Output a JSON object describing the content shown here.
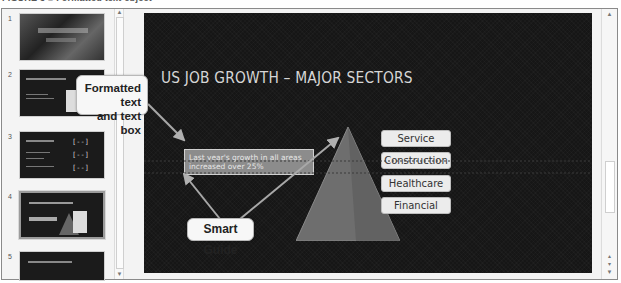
{
  "caption": "FIGURE 3 ■ Formatted text object",
  "thumbnails": [
    {
      "number": "1",
      "title": "US JOB GROWTH",
      "selected": false
    },
    {
      "number": "2",
      "title": "US JOB GROWTH OVERVIEW",
      "selected": false
    },
    {
      "number": "3",
      "title": "MAJOR SECTORS",
      "selected": false
    },
    {
      "number": "4",
      "title": "US JOB GROWTH – MAJOR SECTORS",
      "selected": true
    },
    {
      "number": "5",
      "title": "US JOB GROWTH CHALLENGES",
      "selected": false
    }
  ],
  "slide": {
    "title": "US JOB GROWTH – MAJOR SECTORS",
    "text_box": "Last year's growth in all areas increased over 25%",
    "tiers": [
      "Service",
      "Construction",
      "Healthcare",
      "Financial"
    ]
  },
  "callouts": {
    "formatted_text": "Formatted text and text box",
    "formatted_line1": "Formatted text",
    "formatted_line2": "and text box",
    "smart_guide": "Smart Guide"
  },
  "scrollbar": {
    "up": "▲",
    "down": "▼"
  },
  "colors": {
    "slide_bg": "#161616",
    "text_box_fill": "#8c8c8c",
    "pyramid": "#6e6e6e",
    "tier_fill": "#ececec"
  }
}
